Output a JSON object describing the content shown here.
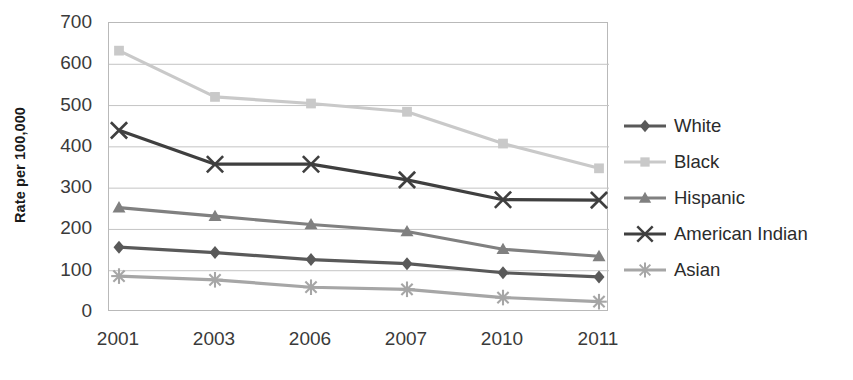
{
  "chart_data": {
    "type": "line",
    "title": "",
    "xlabel": "",
    "ylabel": "Rate per 100,000",
    "categories": [
      "2001",
      "2003",
      "2006",
      "2007",
      "2010",
      "2011"
    ],
    "ylim": [
      0,
      700
    ],
    "ytick_step": 100,
    "yticks": [
      "700",
      "600",
      "500",
      "400",
      "300",
      "200",
      "100",
      "0"
    ],
    "grid": true,
    "legend_position": "right",
    "series": [
      {
        "name": "White",
        "marker": "diamond",
        "color": "#595959",
        "values": [
          157,
          144,
          127,
          117,
          95,
          85
        ]
      },
      {
        "name": "Black",
        "marker": "square",
        "color": "#c9c9c9",
        "values": [
          633,
          521,
          505,
          485,
          408,
          348
        ]
      },
      {
        "name": "Hispanic",
        "marker": "triangle",
        "color": "#808080",
        "values": [
          253,
          232,
          212,
          195,
          152,
          135
        ]
      },
      {
        "name": "American Indian",
        "marker": "x",
        "color": "#3f3f3f",
        "values": [
          440,
          358,
          358,
          320,
          272,
          271
        ]
      },
      {
        "name": "Asian",
        "marker": "asterisk",
        "color": "#a6a6a6",
        "values": [
          87,
          78,
          60,
          55,
          35,
          25
        ]
      }
    ]
  }
}
